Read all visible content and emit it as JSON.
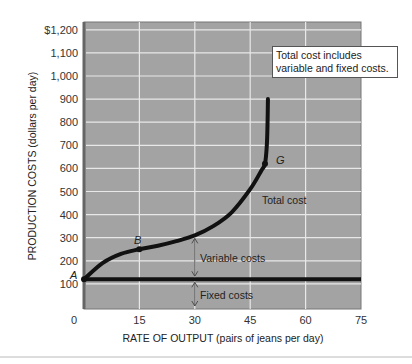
{
  "note": {
    "line1": "Total cost includes",
    "line2": "variable and fixed costs."
  },
  "labels": {
    "total_cost": "Total cost",
    "variable_costs": "Variable costs",
    "fixed_costs": "Fixed costs",
    "point_a": "A",
    "point_b": "B",
    "point_g": "G"
  },
  "chart_data": {
    "type": "line",
    "title": "",
    "xlabel": "RATE OF OUTPUT (pairs of jeans per day)",
    "ylabel": "PRODUCTION COSTS (dollars per day)",
    "xlim": [
      0,
      75
    ],
    "ylim": [
      0,
      1200
    ],
    "x_ticks": [
      "0",
      "15",
      "30",
      "45",
      "60",
      "75"
    ],
    "y_ticks": [
      "100",
      "200",
      "300",
      "400",
      "500",
      "600",
      "700",
      "800",
      "900",
      "1,000",
      "1,100",
      "$1,200"
    ],
    "grid": true,
    "annotation": "Total cost includes variable and fixed costs.",
    "series": [
      {
        "name": "Total cost",
        "points": [
          [
            0,
            120
          ],
          [
            5,
            190
          ],
          [
            10,
            230
          ],
          [
            15,
            250
          ],
          [
            20,
            265
          ],
          [
            25,
            285
          ],
          [
            30,
            310
          ],
          [
            35,
            350
          ],
          [
            40,
            410
          ],
          [
            45,
            510
          ],
          [
            48,
            590
          ],
          [
            49,
            620
          ],
          [
            49.5,
            700
          ],
          [
            49.7,
            800
          ],
          [
            49.8,
            900
          ]
        ]
      },
      {
        "name": "Fixed costs",
        "points": [
          [
            0,
            120
          ],
          [
            75,
            120
          ]
        ]
      }
    ],
    "points": [
      {
        "label": "A",
        "x": 0,
        "y": 120
      },
      {
        "label": "B",
        "x": 15,
        "y": 250
      },
      {
        "label": "G",
        "x": 49,
        "y": 620
      }
    ]
  }
}
